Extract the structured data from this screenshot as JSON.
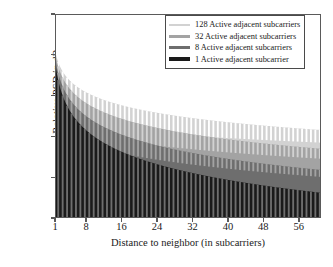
{
  "chart_data": {
    "type": "area",
    "title": "",
    "xlabel": "Distance to neighbor (in subcarriers)",
    "ylabel": "Relative PSD in dB",
    "xlim": [
      1,
      61
    ],
    "ylim": [
      -50,
      0
    ],
    "xticks": [
      1,
      8,
      16,
      24,
      32,
      40,
      48,
      56
    ],
    "yticks": [
      0,
      -10,
      -20,
      -30,
      -40,
      -50
    ],
    "grid": false,
    "legend_position": "top-right",
    "series": [
      {
        "name": "128 Active adjacent subcarriers",
        "color": "#d2d2d2",
        "start_db": -9.7,
        "end_db": -28.2,
        "null_depth_db": -3.0
      },
      {
        "name": "32 Active adjacent subcarriers",
        "color": "#a3a3a3",
        "start_db": -10.4,
        "end_db": -32.8,
        "null_depth_db": -4.5
      },
      {
        "name": "8 Active adjacent subcarriers",
        "color": "#6e6e6e",
        "start_db": -11.6,
        "end_db": -38.0,
        "null_depth_db": -7.0
      },
      {
        "name": "1 Active adjacent subcarrier",
        "color": "#1a1a1a",
        "start_db": -12.9,
        "end_db": -43.6,
        "null_depth_db": -50.0
      }
    ]
  },
  "axes": {
    "y_label": "Relative PSD in dB",
    "x_label": "Distance to neighbor (in subcarriers)",
    "y_ticks": [
      "0",
      "−10",
      "−20",
      "−30",
      "−40",
      "−50"
    ],
    "x_ticks": [
      "1",
      "8",
      "16",
      "24",
      "32",
      "40",
      "48",
      "56"
    ]
  },
  "legend": {
    "items": [
      {
        "label": "128 Active adjacent subcarriers",
        "color": "#d2d2d2"
      },
      {
        "label": "32 Active adjacent subcarriers",
        "color": "#a3a3a3"
      },
      {
        "label": "8 Active adjacent subcarriers",
        "color": "#6e6e6e"
      },
      {
        "label": "1 Active adjacent subcarrier",
        "color": "#1a1a1a"
      }
    ]
  },
  "colors": {
    "axis": "#5a5a5a",
    "text": "#1a1a1a",
    "background": "#ffffff"
  }
}
